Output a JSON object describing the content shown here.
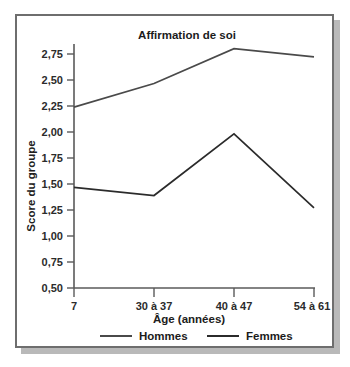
{
  "chart_data": {
    "type": "line",
    "title": "Affirmation de soi",
    "xlabel": "Âge (années)",
    "ylabel": "Score du groupe",
    "categories": [
      "7",
      "30 à 37",
      "40 à 47",
      "54 à 61"
    ],
    "series": [
      {
        "name": "Hommes",
        "values": [
          2.26,
          2.49,
          2.83,
          2.75
        ],
        "color": "#4a4a4a"
      },
      {
        "name": "Femmes",
        "values": [
          1.48,
          1.4,
          2.0,
          1.28
        ],
        "color": "#2b2b2b"
      }
    ],
    "ylim": [
      0.5,
      2.875
    ],
    "yticks": [
      0.5,
      0.75,
      1.0,
      1.25,
      1.5,
      1.75,
      2.0,
      2.25,
      2.5,
      2.75
    ],
    "ytick_labels": [
      "0,50",
      "0,75",
      "1,00",
      "1,25",
      "1,50",
      "1,75",
      "2,00",
      "2,25",
      "2,50",
      "2,75"
    ],
    "grid": false,
    "legend_position": "bottom"
  },
  "legend": {
    "entries": [
      {
        "label": "Hommes"
      },
      {
        "label": "Femmes"
      }
    ]
  },
  "colors": {
    "frame": "#6e6e6e",
    "axis": "#5a5a5a",
    "hommes": "#4a4a4a",
    "femmes": "#2b2b2b",
    "background": "#ffffff"
  }
}
